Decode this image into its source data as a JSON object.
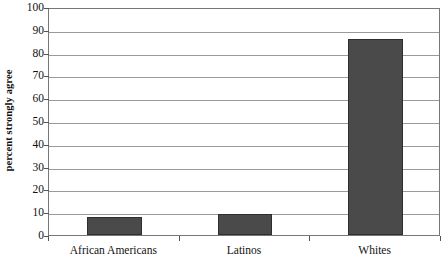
{
  "chart_data": {
    "type": "bar",
    "title": "",
    "xlabel": "",
    "ylabel": "percent strongly agree",
    "categories": [
      "African Americans",
      "Latinos",
      "Whites"
    ],
    "values": [
      8,
      9,
      86
    ],
    "ylim": [
      0,
      100
    ],
    "ytick_labels": [
      "0",
      "10",
      "20",
      "30",
      "40",
      "50",
      "60",
      "70",
      "80",
      "90",
      "100"
    ],
    "ytick_values": [
      0,
      10,
      20,
      30,
      40,
      50,
      60,
      70,
      80,
      90,
      100
    ],
    "grid": "horizontal",
    "legend": "none",
    "bar_color": "#4a4a4a",
    "bar_border_color": "#2e2e2e",
    "gridline_color": "#9a9a9a",
    "axis_color": "#777777",
    "background_color": "#ffffff"
  }
}
